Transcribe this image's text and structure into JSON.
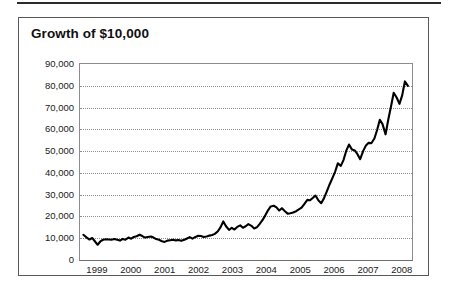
{
  "chart_data": {
    "type": "line",
    "title": "Growth of $10,000",
    "xlabel": "",
    "ylabel": "",
    "ylim": [
      0,
      90000
    ],
    "xlim": [
      1998.5,
      2008.3
    ],
    "grid": true,
    "legend": null,
    "yticks": [
      0,
      10000,
      20000,
      30000,
      40000,
      50000,
      60000,
      70000,
      80000,
      90000
    ],
    "ytick_labels": [
      "0",
      "10,000",
      "20,000",
      "30,000",
      "40,000",
      "50,000",
      "60,000",
      "70,000",
      "80,000",
      "90,000"
    ],
    "xticks": [
      1999,
      2000,
      2001,
      2002,
      2003,
      2004,
      2005,
      2006,
      2007,
      2008
    ],
    "xtick_labels": [
      "1999",
      "2000",
      "2001",
      "2002",
      "2003",
      "2004",
      "2005",
      "2006",
      "2007",
      "2008"
    ],
    "series": [
      {
        "name": "Growth of $10,000",
        "color": "#000000",
        "x": [
          1998.6,
          1998.7,
          1998.78,
          1998.86,
          1998.94,
          1999.02,
          1999.1,
          1999.18,
          1999.27,
          1999.35,
          1999.43,
          1999.51,
          1999.6,
          1999.68,
          1999.76,
          1999.84,
          1999.93,
          2000.01,
          2000.09,
          2000.17,
          2000.26,
          2000.34,
          2000.42,
          2000.5,
          2000.59,
          2000.67,
          2000.75,
          2000.83,
          2000.92,
          2001.0,
          2001.08,
          2001.16,
          2001.25,
          2001.33,
          2001.41,
          2001.49,
          2001.58,
          2001.66,
          2001.74,
          2001.82,
          2001.91,
          2001.99,
          2002.07,
          2002.15,
          2002.24,
          2002.32,
          2002.4,
          2002.48,
          2002.57,
          2002.65,
          2002.73,
          2002.81,
          2002.9,
          2002.98,
          2003.06,
          2003.14,
          2003.23,
          2003.31,
          2003.39,
          2003.47,
          2003.56,
          2003.64,
          2003.72,
          2003.8,
          2003.89,
          2003.97,
          2004.05,
          2004.13,
          2004.22,
          2004.3,
          2004.38,
          2004.46,
          2004.55,
          2004.63,
          2004.71,
          2004.79,
          2004.88,
          2004.96,
          2005.04,
          2005.12,
          2005.21,
          2005.29,
          2005.37,
          2005.45,
          2005.54,
          2005.62,
          2005.7,
          2005.78,
          2005.87,
          2005.95,
          2006.03,
          2006.11,
          2006.2,
          2006.28,
          2006.36,
          2006.44,
          2006.53,
          2006.61,
          2006.69,
          2006.77,
          2006.86,
          2006.94,
          2007.02,
          2007.1,
          2007.19,
          2007.27,
          2007.35,
          2007.43,
          2007.52,
          2007.6,
          2007.68,
          2007.76,
          2007.85,
          2007.93,
          2008.01,
          2008.09,
          2008.18
        ],
        "y": [
          11600,
          10300,
          9400,
          10100,
          8600,
          7000,
          8500,
          9300,
          9500,
          9400,
          9300,
          9600,
          9300,
          8900,
          9700,
          9300,
          10300,
          9800,
          10600,
          10900,
          11600,
          11000,
          10300,
          10600,
          10800,
          10300,
          9600,
          9300,
          8600,
          8300,
          8900,
          9100,
          9300,
          9000,
          9200,
          8800,
          9300,
          9900,
          10500,
          9800,
          10600,
          11100,
          11000,
          10600,
          10800,
          11200,
          11500,
          12000,
          13200,
          15100,
          17700,
          15500,
          13800,
          14800,
          14000,
          15200,
          15900,
          14800,
          15500,
          16500,
          15700,
          14500,
          15000,
          16500,
          18400,
          20500,
          22800,
          24600,
          24900,
          24200,
          22700,
          23800,
          22400,
          21300,
          21500,
          21800,
          22400,
          23200,
          24000,
          25700,
          27600,
          27400,
          28500,
          29600,
          27300,
          26100,
          28300,
          31300,
          34800,
          37600,
          40500,
          44400,
          43200,
          46000,
          50200,
          53000,
          50700,
          50300,
          48600,
          46300,
          50100,
          52600,
          53800,
          53600,
          55800,
          59700,
          64400,
          62400,
          57700,
          64500,
          70500,
          76800,
          74500,
          71700,
          75600,
          82000,
          80000
        ]
      }
    ]
  }
}
